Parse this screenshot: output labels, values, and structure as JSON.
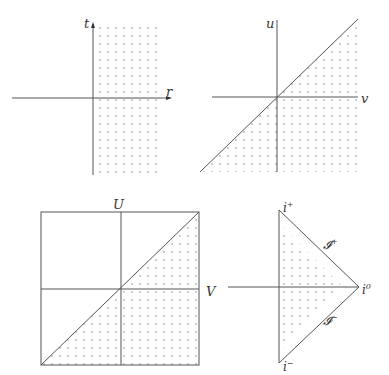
{
  "diagrams": [
    {
      "id": "minkowski-tr",
      "axes": {
        "vertical": "t",
        "horizontal": "r"
      },
      "shaded_region": "r > 0"
    },
    {
      "id": "null-uv",
      "axes": {
        "vertical": "u",
        "horizontal": "v"
      },
      "shaded_region": "v > u (below diagonal)"
    },
    {
      "id": "compactified-UV",
      "axes": {
        "vertical": "U",
        "horizontal": "V"
      },
      "shaded_region": "below diagonal in square"
    },
    {
      "id": "penrose-diagram",
      "labels": {
        "future_timelike": "i",
        "future_timelike_sup": "+",
        "past_timelike": "i",
        "past_timelike_sup": "−",
        "spatial_infinity": "i",
        "spatial_infinity_sup": "0",
        "future_null": "𝓘",
        "future_null_sup": "+",
        "past_null": "𝓘",
        "past_null_sup": "−"
      }
    }
  ],
  "colors": {
    "line": "#555555",
    "dot": "#777777",
    "text": "#333333"
  }
}
